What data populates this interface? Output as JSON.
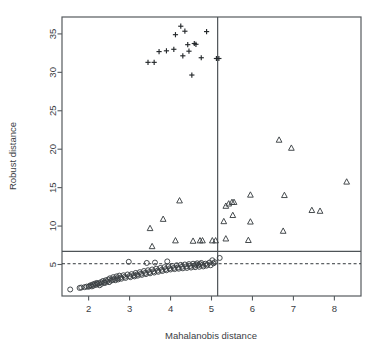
{
  "chart_data": {
    "type": "scatter",
    "title": "",
    "xlabel": "Mahalanobis distance",
    "ylabel": "Robust distance",
    "xlim": [
      1.35,
      8.65
    ],
    "ylim": [
      0.9,
      37.2
    ],
    "xticks": [
      2,
      3,
      4,
      5,
      6,
      7,
      8
    ],
    "yticks": [
      5,
      10,
      15,
      20,
      25,
      30,
      35
    ],
    "grid": false,
    "legend": "none",
    "box": true,
    "reference_lines": [
      {
        "name": "robust-cutoff-solid",
        "orientation": "horizontal",
        "value": 6.7,
        "style": "solid"
      },
      {
        "name": "robust-cutoff-dashed",
        "orientation": "horizontal",
        "value": 5.1,
        "style": "dashed"
      },
      {
        "name": "mahalanobis-cutoff",
        "orientation": "vertical",
        "value": 5.15,
        "style": "solid"
      }
    ],
    "series": [
      {
        "name": "regular-observations",
        "marker": "circle",
        "points": [
          [
            1.55,
            1.75
          ],
          [
            1.78,
            1.95
          ],
          [
            1.82,
            2.0
          ],
          [
            1.9,
            2.05
          ],
          [
            1.95,
            2.12
          ],
          [
            2.0,
            2.1
          ],
          [
            2.02,
            2.2
          ],
          [
            2.05,
            2.3
          ],
          [
            2.08,
            2.15
          ],
          [
            2.1,
            2.4
          ],
          [
            2.12,
            2.25
          ],
          [
            2.15,
            2.5
          ],
          [
            2.18,
            2.35
          ],
          [
            2.2,
            2.6
          ],
          [
            2.22,
            2.45
          ],
          [
            2.25,
            2.55
          ],
          [
            2.27,
            2.3
          ],
          [
            2.3,
            2.7
          ],
          [
            2.32,
            2.5
          ],
          [
            2.35,
            2.85
          ],
          [
            2.38,
            2.65
          ],
          [
            2.4,
            2.6
          ],
          [
            2.42,
            2.95
          ],
          [
            2.45,
            2.8
          ],
          [
            2.48,
            3.05
          ],
          [
            2.5,
            2.7
          ],
          [
            2.52,
            3.2
          ],
          [
            2.55,
            2.9
          ],
          [
            2.58,
            3.0
          ],
          [
            2.6,
            3.35
          ],
          [
            2.62,
            3.1
          ],
          [
            2.65,
            2.95
          ],
          [
            2.68,
            3.45
          ],
          [
            2.7,
            3.2
          ],
          [
            2.72,
            3.05
          ],
          [
            2.75,
            3.55
          ],
          [
            2.78,
            3.3
          ],
          [
            2.8,
            3.15
          ],
          [
            2.85,
            3.6
          ],
          [
            2.88,
            3.4
          ],
          [
            2.9,
            3.25
          ],
          [
            2.95,
            3.7
          ],
          [
            2.98,
            5.35
          ],
          [
            3.0,
            3.5
          ],
          [
            3.02,
            3.35
          ],
          [
            3.05,
            3.75
          ],
          [
            3.1,
            3.6
          ],
          [
            3.12,
            3.45
          ],
          [
            3.15,
            3.9
          ],
          [
            3.18,
            3.7
          ],
          [
            3.2,
            3.55
          ],
          [
            3.25,
            4.0
          ],
          [
            3.28,
            3.8
          ],
          [
            3.3,
            3.65
          ],
          [
            3.35,
            4.15
          ],
          [
            3.38,
            3.9
          ],
          [
            3.4,
            3.75
          ],
          [
            3.42,
            5.2
          ],
          [
            3.45,
            4.25
          ],
          [
            3.48,
            4.0
          ],
          [
            3.5,
            3.85
          ],
          [
            3.55,
            4.35
          ],
          [
            3.58,
            4.1
          ],
          [
            3.6,
            3.95
          ],
          [
            3.62,
            5.25
          ],
          [
            3.65,
            4.45
          ],
          [
            3.68,
            4.2
          ],
          [
            3.7,
            4.05
          ],
          [
            3.75,
            4.55
          ],
          [
            3.78,
            4.3
          ],
          [
            3.8,
            4.15
          ],
          [
            3.85,
            4.65
          ],
          [
            3.88,
            4.4
          ],
          [
            3.9,
            4.25
          ],
          [
            3.92,
            5.4
          ],
          [
            3.95,
            4.75
          ],
          [
            3.98,
            4.5
          ],
          [
            4.0,
            4.35
          ],
          [
            4.05,
            4.8
          ],
          [
            4.08,
            4.55
          ],
          [
            4.1,
            4.4
          ],
          [
            4.15,
            4.9
          ],
          [
            4.18,
            4.6
          ],
          [
            4.2,
            4.45
          ],
          [
            4.25,
            4.95
          ],
          [
            4.28,
            4.7
          ],
          [
            4.3,
            4.5
          ],
          [
            4.35,
            5.0
          ],
          [
            4.38,
            4.75
          ],
          [
            4.4,
            4.55
          ],
          [
            4.45,
            5.05
          ],
          [
            4.48,
            4.8
          ],
          [
            4.5,
            4.6
          ],
          [
            4.55,
            5.1
          ],
          [
            4.58,
            4.85
          ],
          [
            4.6,
            4.65
          ],
          [
            4.62,
            5.0
          ],
          [
            4.65,
            5.15
          ],
          [
            4.68,
            4.9
          ],
          [
            4.7,
            4.7
          ],
          [
            4.72,
            5.05
          ],
          [
            4.75,
            5.2
          ],
          [
            4.78,
            4.95
          ],
          [
            4.8,
            4.75
          ],
          [
            4.85,
            5.1
          ],
          [
            4.88,
            4.85
          ],
          [
            4.9,
            5.0
          ],
          [
            4.95,
            5.25
          ],
          [
            4.98,
            4.9
          ],
          [
            5.02,
            5.55
          ],
          [
            5.05,
            5.15
          ],
          [
            5.08,
            5.3
          ],
          [
            5.2,
            5.85
          ]
        ]
      },
      {
        "name": "moderate-outliers",
        "marker": "triangle",
        "points": [
          [
            3.5,
            9.7
          ],
          [
            3.55,
            7.35
          ],
          [
            3.82,
            10.9
          ],
          [
            4.22,
            13.3
          ],
          [
            4.12,
            8.1
          ],
          [
            4.55,
            8.05
          ],
          [
            4.72,
            8.1
          ],
          [
            4.78,
            8.1
          ],
          [
            5.02,
            8.1
          ],
          [
            5.1,
            8.1
          ],
          [
            5.3,
            10.6
          ],
          [
            5.35,
            12.6
          ],
          [
            5.42,
            12.9
          ],
          [
            5.5,
            13.1
          ],
          [
            5.55,
            13.1
          ],
          [
            5.52,
            11.4
          ],
          [
            5.35,
            8.35
          ],
          [
            5.95,
            14.05
          ],
          [
            5.95,
            10.55
          ],
          [
            5.9,
            8.15
          ],
          [
            6.65,
            21.2
          ],
          [
            6.95,
            20.15
          ],
          [
            6.78,
            14.0
          ],
          [
            6.75,
            9.35
          ],
          [
            7.45,
            12.05
          ],
          [
            7.65,
            11.95
          ],
          [
            8.3,
            15.75
          ]
        ]
      },
      {
        "name": "extreme-outliers",
        "marker": "plus",
        "points": [
          [
            3.45,
            31.3
          ],
          [
            3.6,
            31.3
          ],
          [
            3.72,
            32.7
          ],
          [
            3.9,
            32.8
          ],
          [
            4.08,
            33.0
          ],
          [
            4.12,
            34.9
          ],
          [
            4.25,
            36.0
          ],
          [
            4.35,
            35.35
          ],
          [
            4.3,
            32.15
          ],
          [
            4.45,
            32.75
          ],
          [
            4.42,
            33.6
          ],
          [
            4.58,
            33.75
          ],
          [
            4.62,
            33.65
          ],
          [
            4.52,
            29.65
          ],
          [
            4.75,
            31.9
          ],
          [
            4.88,
            35.3
          ],
          [
            5.12,
            31.8
          ],
          [
            5.18,
            31.8
          ]
        ]
      }
    ]
  },
  "axis": {
    "x_tick_labels": [
      "2",
      "3",
      "4",
      "5",
      "6",
      "7",
      "8"
    ],
    "y_tick_labels": [
      "5",
      "10",
      "15",
      "20",
      "25",
      "30",
      "35"
    ],
    "x_title": "Mahalanobis distance",
    "y_title": "Robust distance"
  },
  "colors": {
    "background": "#ffffff",
    "axis": "#555a5e",
    "marker": "#3c4145",
    "plus_marker": "#25292c",
    "text": "#3b4044"
  }
}
